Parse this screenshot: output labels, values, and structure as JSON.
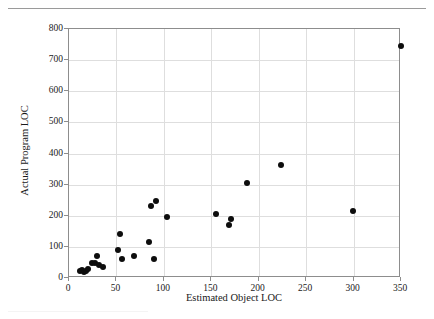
{
  "chart_data": {
    "type": "scatter",
    "title": "",
    "xlabel": "Estimated Object LOC",
    "ylabel": "Actual Program LOC",
    "xlim": [
      0,
      350
    ],
    "ylim": [
      0,
      800
    ],
    "xticks": [
      0,
      50,
      100,
      150,
      200,
      250,
      300,
      350
    ],
    "yticks": [
      0,
      100,
      200,
      300,
      400,
      500,
      600,
      700,
      800
    ],
    "grid": true,
    "legend": null,
    "marker": {
      "shape": "circle",
      "color": "#0d0d0d",
      "size": 6
    },
    "series": [
      {
        "name": "projects",
        "points": [
          {
            "x": 12,
            "y": 22
          },
          {
            "x": 14,
            "y": 25
          },
          {
            "x": 16,
            "y": 20
          },
          {
            "x": 18,
            "y": 24
          },
          {
            "x": 20,
            "y": 30
          },
          {
            "x": 24,
            "y": 47
          },
          {
            "x": 27,
            "y": 47
          },
          {
            "x": 30,
            "y": 70
          },
          {
            "x": 32,
            "y": 42
          },
          {
            "x": 36,
            "y": 35
          },
          {
            "x": 52,
            "y": 90
          },
          {
            "x": 54,
            "y": 140
          },
          {
            "x": 56,
            "y": 61
          },
          {
            "x": 69,
            "y": 72
          },
          {
            "x": 84,
            "y": 115
          },
          {
            "x": 86,
            "y": 232
          },
          {
            "x": 90,
            "y": 62
          },
          {
            "x": 92,
            "y": 248
          },
          {
            "x": 103,
            "y": 197
          },
          {
            "x": 155,
            "y": 206
          },
          {
            "x": 169,
            "y": 171
          },
          {
            "x": 171,
            "y": 188
          },
          {
            "x": 188,
            "y": 304
          },
          {
            "x": 224,
            "y": 364
          },
          {
            "x": 299,
            "y": 214
          },
          {
            "x": 350,
            "y": 745
          }
        ]
      }
    ]
  },
  "axes": {
    "x_tick_labels": [
      "0",
      "50",
      "100",
      "150",
      "200",
      "250",
      "300",
      "350"
    ],
    "y_tick_labels": [
      "0",
      "100",
      "200",
      "300",
      "400",
      "500",
      "600",
      "700",
      "800"
    ],
    "x_axis_title": "Estimated Object LOC",
    "y_axis_title": "Actual Program LOC"
  }
}
